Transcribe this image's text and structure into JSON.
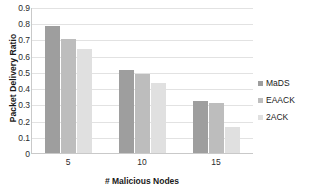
{
  "chart_data": {
    "type": "bar",
    "title": "",
    "xlabel": "# Malicious Nodes",
    "ylabel": "Packet Delivery Ratio",
    "categories": [
      "5",
      "10",
      "15"
    ],
    "series": [
      {
        "name": "MaDS",
        "values": [
          0.78,
          0.51,
          0.32
        ],
        "color": "#9e9e9e"
      },
      {
        "name": "EAACK",
        "values": [
          0.7,
          0.49,
          0.31
        ],
        "color": "#bdbdbd"
      },
      {
        "name": "2ACK",
        "values": [
          0.64,
          0.43,
          0.16
        ],
        "color": "#e0e0e0"
      }
    ],
    "ylim": [
      0,
      0.9
    ],
    "yticks": [
      "0",
      "0.1",
      "0.2",
      "0.3",
      "0.4",
      "0.5",
      "0.6",
      "0.7",
      "0.8",
      "0.9"
    ],
    "grid": true,
    "legend_position": "right"
  }
}
